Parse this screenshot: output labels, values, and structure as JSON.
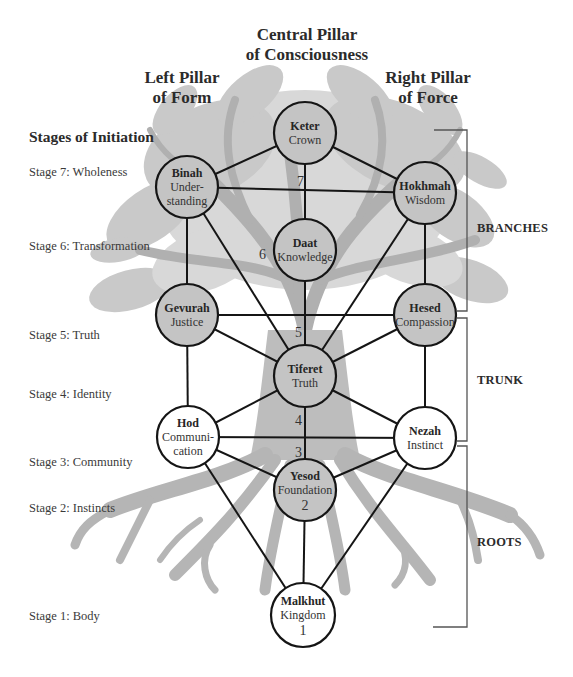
{
  "headers": {
    "central_pillar": [
      "Central Pillar",
      "of Consciousness"
    ],
    "left_pillar": [
      "Left Pillar",
      "of Form"
    ],
    "right_pillar": [
      "Right Pillar",
      "of Force"
    ]
  },
  "stages": {
    "title": "Stages of Initiation",
    "items": [
      {
        "id": "stage7",
        "label": "Stage 7: Wholeness"
      },
      {
        "id": "stage6",
        "label": "Stage 6: Transformation"
      },
      {
        "id": "stage5",
        "label": "Stage 5: Truth"
      },
      {
        "id": "stage4",
        "label": "Stage 4: Identity"
      },
      {
        "id": "stage3",
        "label": "Stage 3: Community"
      },
      {
        "id": "stage2",
        "label": "Stage 2: Instincts"
      },
      {
        "id": "stage1",
        "label": "Stage 1: Body"
      }
    ]
  },
  "sections": [
    {
      "id": "branches",
      "label": "BRANCHES"
    },
    {
      "id": "trunk",
      "label": "TRUNK"
    },
    {
      "id": "roots",
      "label": "ROOTS"
    }
  ],
  "nodes": [
    {
      "id": "keter",
      "name": "Keter",
      "sub": [
        "Crown"
      ]
    },
    {
      "id": "binah",
      "name": "Binah",
      "sub": [
        "Under-",
        "standing"
      ]
    },
    {
      "id": "hokhmah",
      "name": "Hokhmah",
      "sub": [
        "Wisdom"
      ]
    },
    {
      "id": "daat",
      "name": "Daat",
      "sub": [
        "Knowledge"
      ]
    },
    {
      "id": "gevurah",
      "name": "Gevurah",
      "sub": [
        "Justice"
      ]
    },
    {
      "id": "hesed",
      "name": "Hesed",
      "sub": [
        "Compassion"
      ]
    },
    {
      "id": "tiferet",
      "name": "Tiferet",
      "sub": [
        "Truth"
      ]
    },
    {
      "id": "hod",
      "name": "Hod",
      "sub": [
        "Communi-",
        "cation"
      ]
    },
    {
      "id": "nezah",
      "name": "Nezah",
      "sub": [
        "Instinct"
      ]
    },
    {
      "id": "yesod",
      "name": "Yesod",
      "sub": [
        "Foundation"
      ],
      "number": "2"
    },
    {
      "id": "malkhut",
      "name": "Malkhut",
      "sub": [
        "Kingdom"
      ],
      "number": "1"
    }
  ],
  "edges": [
    [
      "keter",
      "binah"
    ],
    [
      "keter",
      "hokhmah"
    ],
    [
      "keter",
      "daat"
    ],
    [
      "binah",
      "hokhmah"
    ],
    [
      "binah",
      "gevurah"
    ],
    [
      "binah",
      "tiferet"
    ],
    [
      "hokhmah",
      "hesed"
    ],
    [
      "hokhmah",
      "tiferet"
    ],
    [
      "daat",
      "tiferet"
    ],
    [
      "gevurah",
      "hesed"
    ],
    [
      "gevurah",
      "tiferet"
    ],
    [
      "gevurah",
      "hod"
    ],
    [
      "hesed",
      "tiferet"
    ],
    [
      "hesed",
      "nezah"
    ],
    [
      "tiferet",
      "hod"
    ],
    [
      "tiferet",
      "nezah"
    ],
    [
      "tiferet",
      "yesod"
    ],
    [
      "hod",
      "nezah"
    ],
    [
      "hod",
      "yesod"
    ],
    [
      "hod",
      "malkhut"
    ],
    [
      "nezah",
      "yesod"
    ],
    [
      "nezah",
      "malkhut"
    ],
    [
      "yesod",
      "malkhut"
    ]
  ],
  "path_numbers": [
    {
      "id": "n7",
      "value": "7"
    },
    {
      "id": "n6",
      "value": "6"
    },
    {
      "id": "n5",
      "value": "5"
    },
    {
      "id": "n4",
      "value": "4"
    },
    {
      "id": "n3",
      "value": "3"
    }
  ],
  "colors": {
    "line": "#151515",
    "tree": "#bdbdbd",
    "node_fill_on_tree": "#c4c4c4",
    "node_fill_plain": "#ffffff",
    "text": "#2b2b2b"
  }
}
